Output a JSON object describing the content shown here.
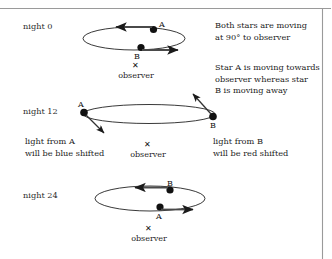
{
  "figure": {
    "title_absent": true,
    "colors": {
      "line": "#222222",
      "rule": "#9a9a9a",
      "text": "#1c1c1c",
      "background": "#ffffff"
    },
    "rules": {
      "top_rule": "horizontal-rule",
      "right_rule": "vertical-rule"
    },
    "panels": [
      {
        "id": "night-0",
        "night_label": "night 0",
        "orbit": "ellipse",
        "stars": [
          {
            "id": "A",
            "label": "A",
            "position": "top-right-of-orbit",
            "motion_arrow": "left"
          },
          {
            "id": "B",
            "label": "B",
            "position": "bottom-center-of-orbit",
            "motion_arrow": "right"
          }
        ],
        "observer_marker": "✕",
        "observer_label": "observer",
        "annotation": "Both stars are moving\nat 90° to observer"
      },
      {
        "id": "night-12",
        "night_label": "night 12",
        "orbit": "ellipse",
        "stars": [
          {
            "id": "A",
            "label": "A",
            "position": "left-end-of-orbit",
            "motion_arrow": "down-right"
          },
          {
            "id": "B",
            "label": "B",
            "position": "right-end-of-orbit",
            "motion_arrow": "up-left"
          }
        ],
        "observer_marker": "✕",
        "observer_label": "observer",
        "annotation": "Star A is moving towards\nobserver whereas star\nB is moving away",
        "note_left": "light from A\nwill be blue shifted",
        "note_right": "light from B\nwill be red shifted"
      },
      {
        "id": "night-24",
        "night_label": "night 24",
        "orbit": "ellipse",
        "stars": [
          {
            "id": "B",
            "label": "B",
            "position": "top-center-of-orbit",
            "motion_arrow": "left"
          },
          {
            "id": "A",
            "label": "A",
            "position": "bottom-center-of-orbit",
            "motion_arrow": "right"
          }
        ],
        "observer_marker": "✕",
        "observer_label": "observer"
      }
    ]
  }
}
